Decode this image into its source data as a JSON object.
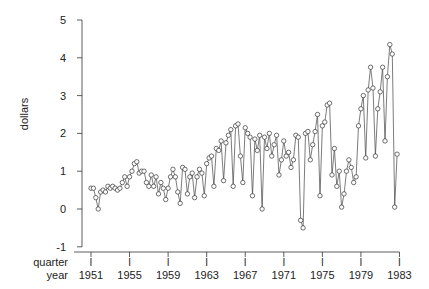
{
  "chart_data": {
    "type": "line",
    "title": "",
    "xlabel": "quarter / year",
    "ylabel": "dollars",
    "ylim": [
      -1,
      5
    ],
    "yticks": [
      -1,
      0,
      1,
      2,
      3,
      4,
      5
    ],
    "xticks": [
      {
        "quarter": "I",
        "year": "1951"
      },
      {
        "quarter": "I",
        "year": "1955"
      },
      {
        "quarter": "I",
        "year": "1959"
      },
      {
        "quarter": "I",
        "year": "1963"
      },
      {
        "quarter": "I",
        "year": "1967"
      },
      {
        "quarter": "I",
        "year": "1971"
      },
      {
        "quarter": "I",
        "year": "1975"
      },
      {
        "quarter": "I",
        "year": "1979"
      },
      {
        "quarter": "I",
        "year": "1983"
      }
    ],
    "grid": false,
    "legend": null,
    "marker": "open-circle",
    "x_start": "1951 Q1",
    "series": [
      {
        "name": "quarterly earnings",
        "values": [
          0.55,
          0.55,
          0.3,
          0.0,
          0.45,
          0.5,
          0.45,
          0.6,
          0.55,
          0.6,
          0.55,
          0.5,
          0.55,
          0.7,
          0.85,
          0.6,
          0.85,
          1.0,
          1.2,
          1.25,
          0.95,
          1.0,
          1.0,
          0.7,
          0.6,
          0.9,
          0.6,
          0.85,
          0.4,
          0.7,
          0.55,
          0.25,
          0.55,
          0.85,
          1.05,
          0.85,
          0.45,
          0.15,
          1.1,
          1.05,
          0.4,
          0.85,
          0.95,
          0.3,
          0.85,
          1.05,
          0.95,
          0.35,
          1.2,
          1.35,
          1.4,
          0.6,
          1.6,
          1.55,
          1.8,
          0.75,
          1.75,
          1.95,
          2.1,
          0.6,
          2.2,
          2.25,
          1.4,
          0.7,
          2.15,
          2.0,
          1.9,
          0.35,
          1.85,
          1.55,
          1.95,
          0.0,
          1.9,
          1.6,
          2.0,
          1.4,
          1.7,
          1.95,
          0.9,
          1.3,
          1.8,
          1.4,
          1.5,
          1.1,
          1.3,
          1.95,
          1.9,
          -0.3,
          -0.5,
          2.0,
          2.05,
          1.3,
          1.7,
          2.05,
          2.5,
          0.35,
          2.2,
          2.3,
          2.75,
          2.8,
          0.9,
          1.6,
          0.6,
          1.0,
          0.05,
          0.4,
          1.0,
          1.3,
          1.1,
          0.7,
          0.85,
          2.2,
          2.65,
          3.0,
          1.35,
          3.15,
          3.75,
          3.2,
          1.4,
          2.65,
          3.1,
          3.75,
          1.8,
          3.5,
          4.35,
          4.1,
          0.05,
          1.45
        ]
      }
    ]
  },
  "axes": {
    "ylabel": "dollars",
    "xlabel_line1": "quarter",
    "xlabel_line2": "year",
    "quarter_tick_label": "I"
  }
}
